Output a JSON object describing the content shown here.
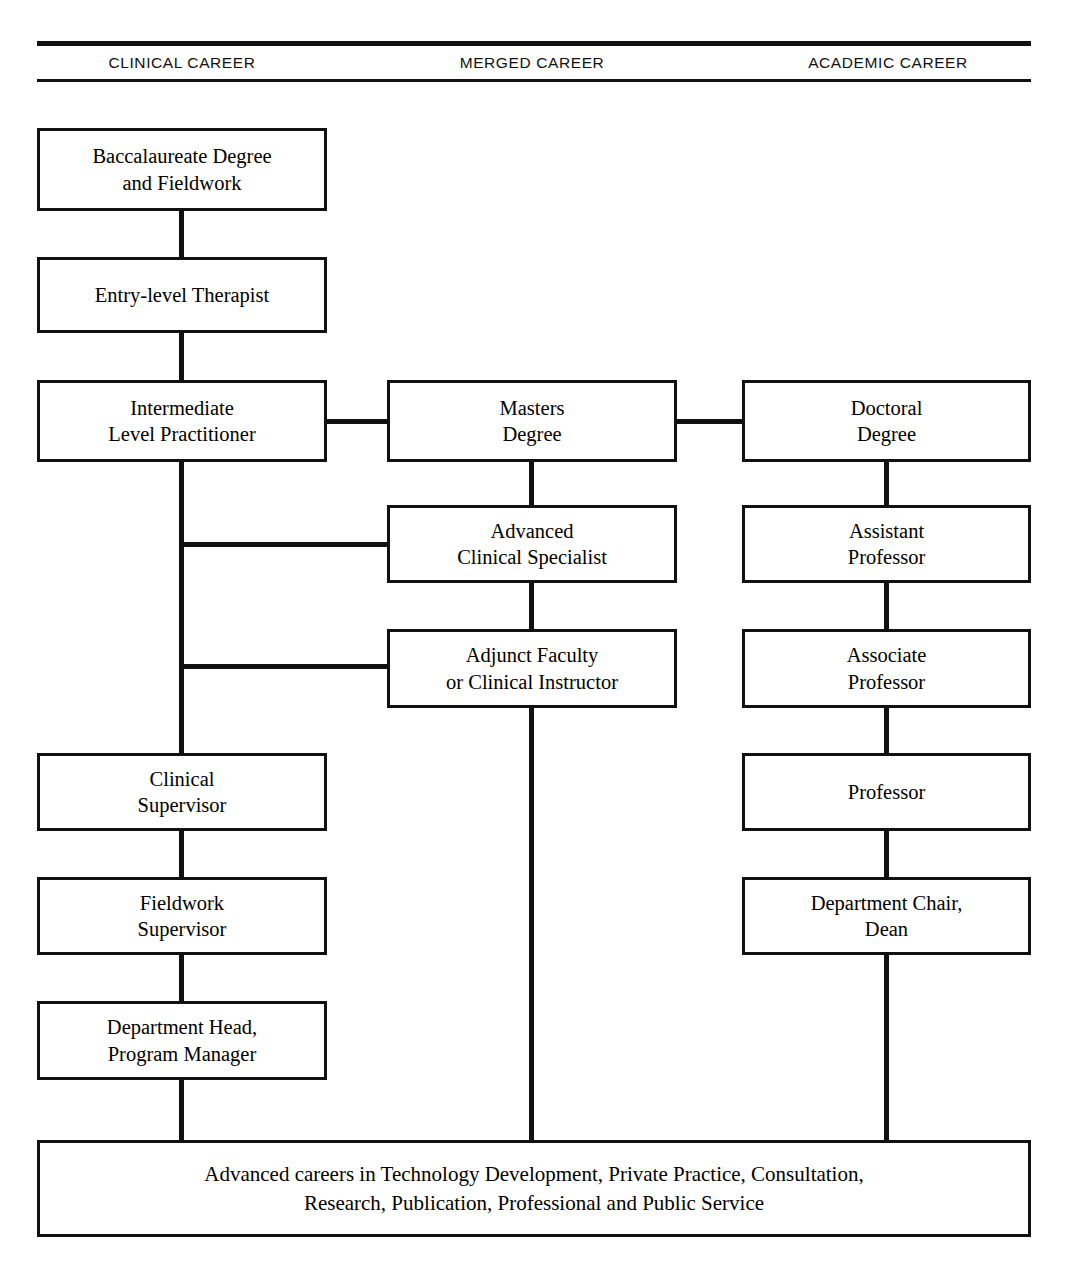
{
  "diagram": {
    "line_color": "#111111",
    "background_color": "#ffffff",
    "columns": [
      {
        "id": "clinical",
        "label": "CLINICAL CAREER"
      },
      {
        "id": "merged",
        "label": "MERGED CAREER"
      },
      {
        "id": "academic",
        "label": "ACADEMIC CAREER"
      }
    ],
    "nodes": {
      "baccalaureate": "Baccalaureate Degree\nand Fieldwork",
      "entry_level": "Entry-level Therapist",
      "intermediate": "Intermediate\nLevel Practitioner",
      "clinical_supervisor": "Clinical\nSupervisor",
      "fieldwork_supervisor": "Fieldwork\nSupervisor",
      "department_head": "Department Head,\nProgram Manager",
      "masters": "Masters\nDegree",
      "advanced_specialist": "Advanced\nClinical Specialist",
      "adjunct_faculty": "Adjunct Faculty\nor Clinical Instructor",
      "doctoral": "Doctoral\nDegree",
      "assistant_professor": "Assistant\nProfessor",
      "associate_professor": "Associate\nProfessor",
      "professor": "Professor",
      "department_chair": "Department Chair,\nDean",
      "banner": "Advanced careers in Technology Development, Private Practice, Consultation,\nResearch, Publication, Professional and Public Service"
    }
  }
}
